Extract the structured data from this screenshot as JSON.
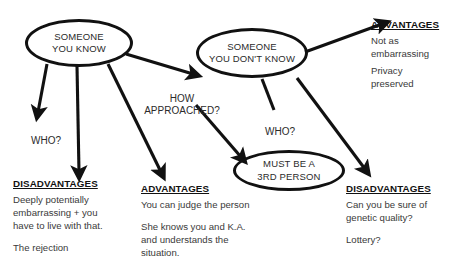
{
  "diagram": {
    "ink_color": "#111111",
    "text_color": "#3a3a3a",
    "nodes": [
      {
        "id": "known",
        "text": "SOMEONE\nYOU KNOW"
      },
      {
        "id": "unknown",
        "text": "SOMEONE\nYOU DON'T KNOW"
      },
      {
        "id": "third",
        "text": "MUST BE A\n3RD PERSON"
      }
    ],
    "edge_labels": [
      {
        "id": "who_left",
        "text": "WHO?"
      },
      {
        "id": "how",
        "text": "HOW\nAPPROACHED?"
      },
      {
        "id": "who_right",
        "text": "WHO?"
      }
    ],
    "blocks": [
      {
        "id": "adv_top_right",
        "head": "ADVANTAGES",
        "paras": [
          "Not as\nembarrassing",
          "Privacy\npreserved"
        ]
      },
      {
        "id": "dis_bottom_left",
        "head": "DISADVANTAGES",
        "paras": [
          "Deeply potentially\nembarrassing + you\nhave to live with that.",
          "The rejection"
        ]
      },
      {
        "id": "adv_bottom_mid",
        "head": "ADVANTAGES",
        "paras": [
          "You can judge the person",
          "She knows you and K.A.\nand understands the\nsituation."
        ]
      },
      {
        "id": "dis_bottom_right",
        "head": "DISADVANTAGES",
        "paras": [
          "Can you be sure of\ngenetic quality?",
          "Lottery?"
        ]
      }
    ]
  }
}
